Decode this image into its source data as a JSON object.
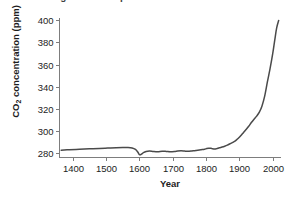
{
  "chart_data": {
    "type": "line",
    "title": "Global changes in atmospheric CO2 over time",
    "xlabel": "Year",
    "ylabel": "CO2 concentration (ppm)",
    "ylabel_parts": {
      "pre": "CO",
      "sub": "2",
      "post": " concentration (ppm)"
    },
    "xlim": [
      1360,
      2025
    ],
    "ylim": [
      276,
      402
    ],
    "xticks": [
      1400,
      1500,
      1600,
      1700,
      1800,
      1900,
      2000
    ],
    "yticks": [
      280,
      300,
      320,
      340,
      360,
      380,
      400
    ],
    "grid": false,
    "legend": false,
    "line_color": "#4a4a4a",
    "axis_color": "#7d7d7d",
    "background": "#ffffff",
    "series": [
      {
        "name": "Atmospheric CO2",
        "x": [
          1365,
          1390,
          1420,
          1450,
          1480,
          1505,
          1530,
          1550,
          1565,
          1578,
          1588,
          1595,
          1600,
          1605,
          1612,
          1620,
          1630,
          1642,
          1655,
          1668,
          1680,
          1692,
          1705,
          1715,
          1725,
          1735,
          1745,
          1755,
          1765,
          1775,
          1785,
          1795,
          1802,
          1808,
          1815,
          1820,
          1826,
          1832,
          1840,
          1848,
          1856,
          1864,
          1872,
          1880,
          1888,
          1896,
          1904,
          1912,
          1920,
          1928,
          1936,
          1944,
          1952,
          1960,
          1968,
          1976,
          1984,
          1992,
          2000,
          2006,
          2012,
          2018
        ],
        "y": [
          282.6,
          283.0,
          283.4,
          283.8,
          284.2,
          284.5,
          284.8,
          285.0,
          285.0,
          284.6,
          283.3,
          281.0,
          278.6,
          278.8,
          280.4,
          281.4,
          281.8,
          281.4,
          281.2,
          281.6,
          281.5,
          281.2,
          281.4,
          281.8,
          282.0,
          281.8,
          281.6,
          281.8,
          282.2,
          282.6,
          283.0,
          283.4,
          284.1,
          284.4,
          284.3,
          283.8,
          283.6,
          284.0,
          284.8,
          285.4,
          286.2,
          287.2,
          288.4,
          289.6,
          291.0,
          293.2,
          295.6,
          298.4,
          301.2,
          304.2,
          307.6,
          310.6,
          313.4,
          317.0,
          322.6,
          331.4,
          344.0,
          356.0,
          369.5,
          381.5,
          393.0,
          399.8
        ]
      }
    ]
  },
  "axes": {
    "x_tick_labels": [
      "1400",
      "1500",
      "1600",
      "1700",
      "1800",
      "1900",
      "2000"
    ],
    "y_tick_labels": [
      "280",
      "300",
      "320",
      "340",
      "360",
      "380",
      "400"
    ]
  }
}
